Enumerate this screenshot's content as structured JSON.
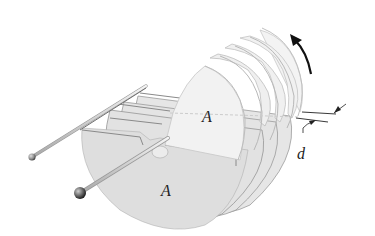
{
  "diagram": {
    "type": "variable-capacitor",
    "labels": {
      "area_upper": "A",
      "area_lower": "A",
      "separation": "d"
    },
    "annotations": {
      "rotation_arrow": "rotation-direction",
      "separation_marker": "plate-spacing"
    },
    "colors": {
      "background": "#ffffff",
      "fixed_plate": "#e2e2e2",
      "rotor_plate": "#f1f1f1",
      "plate_edge": "#8a8a8a",
      "rod": "#d8d8d8",
      "arrow": "#111111",
      "knob": "#555555"
    }
  }
}
